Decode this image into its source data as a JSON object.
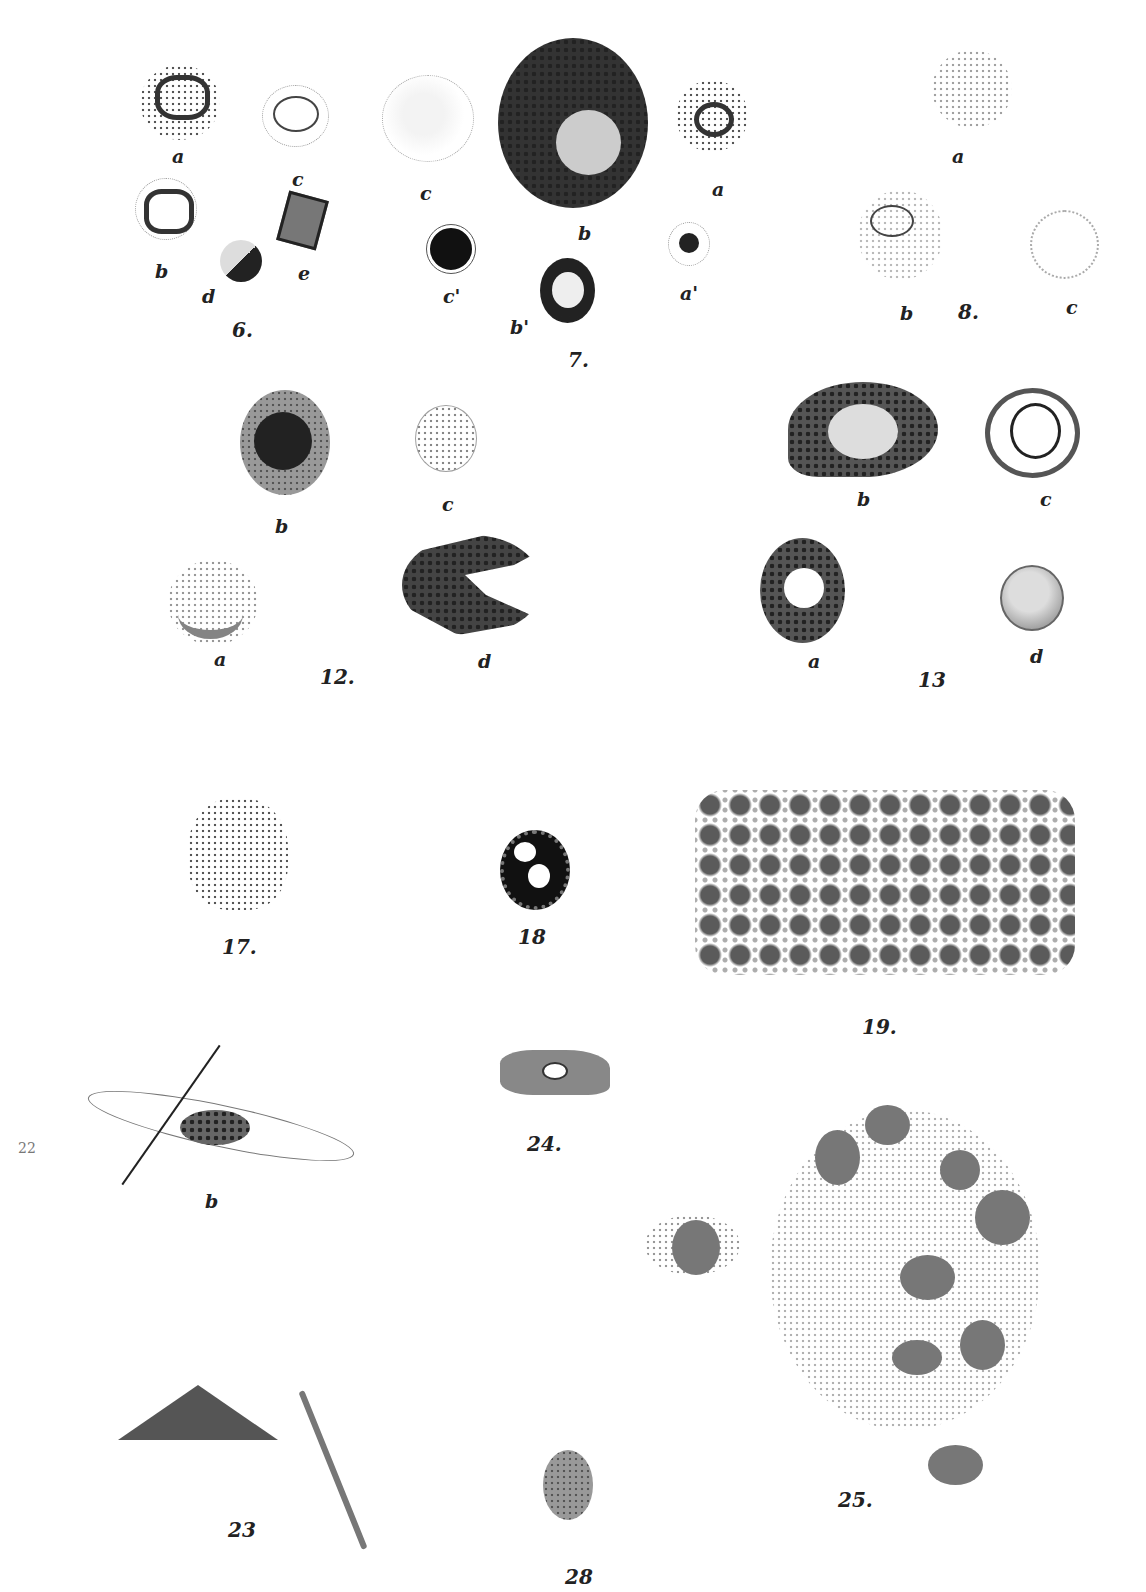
{
  "plate": {
    "figures": [
      {
        "number": "6.",
        "labels": [
          "a",
          "b",
          "c",
          "d",
          "e"
        ]
      },
      {
        "number": "7.",
        "labels": [
          "a",
          "b",
          "c",
          "a'",
          "b'",
          "c'"
        ]
      },
      {
        "number": "8.",
        "labels": [
          "a",
          "b",
          "c"
        ]
      },
      {
        "number": "12.",
        "labels": [
          "a",
          "b",
          "c",
          "d"
        ]
      },
      {
        "number": "13",
        "labels": [
          "a",
          "b",
          "c",
          "d"
        ]
      },
      {
        "number": "17.",
        "labels": []
      },
      {
        "number": "18",
        "labels": []
      },
      {
        "number": "19.",
        "labels": []
      },
      {
        "number": "22",
        "labels": [
          "b"
        ]
      },
      {
        "number": "23",
        "labels": []
      },
      {
        "number": "24.",
        "labels": []
      },
      {
        "number": "25.",
        "labels": []
      },
      {
        "number": "28",
        "labels": []
      }
    ]
  },
  "labels": {
    "f6a": "a",
    "f6c": "c",
    "f6b": "b",
    "f6d": "d",
    "f6e": "e",
    "f6": "6.",
    "f7c": "c",
    "f7b": "b",
    "f7a": "a",
    "f7c2": "c'",
    "f7b2": "b'",
    "f7a2": "a'",
    "f7": "7.",
    "f8a": "a",
    "f8b": "b",
    "f8": "8.",
    "f8c": "c",
    "f12b": "b",
    "f12c": "c",
    "f12a": "a",
    "f12": "12.",
    "f12d": "d",
    "f13b": "b",
    "f13c": "c",
    "f13a": "a",
    "f13": "13",
    "f13d": "d",
    "f17": "17.",
    "f18": "18",
    "f19": "19.",
    "f22": "22",
    "f22b": "b",
    "f24": "24.",
    "f25": "25.",
    "f23": "23",
    "f28": "28"
  }
}
